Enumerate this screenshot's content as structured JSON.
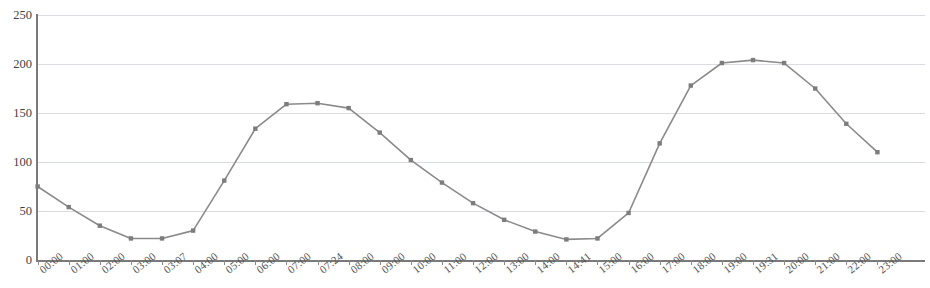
{
  "chart_data": {
    "type": "line",
    "title": "",
    "subtitle": "",
    "xlabel": "",
    "ylabel": "",
    "ylim": [
      0,
      250
    ],
    "yticks": [
      0,
      50,
      100,
      150,
      200,
      250
    ],
    "grid": true,
    "legend": false,
    "legend_position": "none",
    "marker": "square",
    "line_color": "#8a8a8a",
    "marker_color": "#7d7d7d",
    "grid_color": "#d9dde2",
    "axis_color": "#7a7a7a",
    "categories": [
      "00:00",
      "01:00",
      "02:00",
      "03:00",
      "03:07",
      "04:00",
      "05:00",
      "06:00",
      "07:00",
      "07:24",
      "08:00",
      "09:00",
      "10:00",
      "11:00",
      "12:00",
      "13:00",
      "14:00",
      "14:41",
      "15:00",
      "16:00",
      "17:00",
      "18:00",
      "19:00",
      "19:31",
      "20:00",
      "21:00",
      "22:00",
      "23:00"
    ],
    "values": [
      75,
      54,
      35,
      22,
      22,
      30,
      81,
      134,
      159,
      160,
      155,
      130,
      102,
      79,
      58,
      41,
      29,
      21,
      22,
      48,
      119,
      178,
      201,
      204,
      201,
      175,
      139,
      110
    ],
    "x_tick_labels": [
      "00:00",
      "01:00",
      "02:00",
      "03:00",
      "03:07",
      "04:00",
      "05:00",
      "06:00",
      "07:00",
      "07:24",
      "08:00",
      "09:00",
      "10:00",
      "11:00",
      "12:00",
      "13:00",
      "14:00",
      "14:41",
      "15:00",
      "16:00",
      "17:00",
      "18:00",
      "19:00",
      "19:31",
      "20:00",
      "21:00",
      "22:00",
      "23:00"
    ],
    "y_tick_labels": [
      "0",
      "50",
      "100",
      "150",
      "200",
      "250"
    ]
  }
}
